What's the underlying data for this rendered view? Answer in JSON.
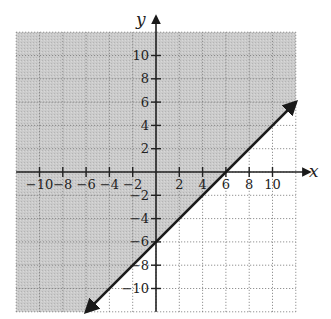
{
  "chart_data": {
    "type": "line",
    "title": "",
    "xlabel": "x",
    "ylabel": "y",
    "xlim": [
      -12,
      12
    ],
    "ylim": [
      -12,
      12
    ],
    "grid": true,
    "grid_step": 2,
    "x_ticks": [
      -10,
      -8,
      -6,
      -4,
      -2,
      2,
      4,
      6,
      8,
      10
    ],
    "y_ticks": [
      -10,
      -8,
      -6,
      -4,
      -2,
      2,
      4,
      6,
      8,
      10
    ],
    "x_tick_labels": [
      "−10",
      "−8",
      "−6",
      "−4",
      "−2",
      "2",
      "4",
      "6",
      "8",
      "10"
    ],
    "y_tick_labels": [
      "−10",
      "−8",
      "−6",
      "−4",
      "−2",
      "2",
      "4",
      "6",
      "8",
      "10"
    ],
    "series": [
      {
        "name": "boundary line y = x - 6",
        "style": "solid",
        "arrows": "both",
        "points": [
          [
            -6,
            -12
          ],
          [
            12,
            6
          ]
        ],
        "slope": 1,
        "y_intercept": -6,
        "x_intercept": 6
      }
    ],
    "shaded_region": {
      "description": "region above and to the left of the line",
      "inequality": "y >= x - 6",
      "color": "#c9c9c9"
    }
  },
  "colors": {
    "shade": "#c9c9c9",
    "grid": "#7a7a7a",
    "axis": "#222222",
    "line": "#1a1a1a"
  }
}
